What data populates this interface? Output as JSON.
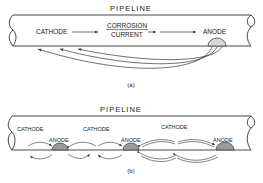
{
  "diagram_a": {
    "title": "PIPELINE",
    "cathode_label": "CATHODE",
    "current_label_line1": "CORROSION",
    "current_label_line2": "CURRENT",
    "anode_label": "ANODE",
    "caption": "(a)"
  },
  "diagram_b": {
    "title": "PIPELINE",
    "cathode_labels": [
      "CATHODE",
      "CATHODE",
      "CATHODE"
    ],
    "anode_labels": [
      "ANODE",
      "ANODE",
      "ANODE"
    ],
    "caption": "(b)"
  },
  "colors": {
    "line": "#333333",
    "anode_fill_a": "#d8d8d8",
    "anode_fill_b": "#9a9a9a"
  }
}
